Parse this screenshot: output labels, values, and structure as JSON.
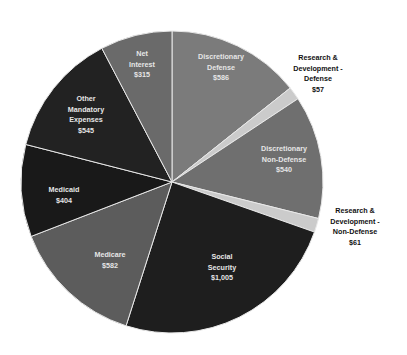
{
  "chart_data": {
    "type": "pie",
    "title": "",
    "start_angle_deg": 0,
    "direction": "clockwise",
    "center": [
      172,
      182
    ],
    "radius": 151,
    "slices": [
      {
        "label": "Discretionary Defense",
        "value": 586,
        "color": "#7b7b7b",
        "label_lines": [
          "Discretionary",
          "Defense",
          "$586"
        ],
        "label_pos": [
          221,
          52
        ],
        "label_style": "in"
      },
      {
        "label": "Research & Development - Defense",
        "value": 57,
        "color": "#cbcbcb",
        "label_lines": [
          "Research &",
          "Development -",
          "Defense",
          "$57"
        ],
        "label_pos": [
          318,
          53
        ],
        "label_style": "out"
      },
      {
        "label": "Discretionary Non-Defense",
        "value": 540,
        "color": "#6f6f6f",
        "label_lines": [
          "Discretionary",
          "Non-Defense",
          "$540"
        ],
        "label_pos": [
          284,
          144
        ],
        "label_style": "in"
      },
      {
        "label": "Research & Development - Non-Defense",
        "value": 61,
        "color": "#cbcbcb",
        "label_lines": [
          "Research &",
          "Development -",
          "Non-Defense",
          "$61"
        ],
        "label_pos": [
          355,
          206
        ],
        "label_style": "out"
      },
      {
        "label": "Social Security",
        "value": 1005,
        "color": "#1e1e1e",
        "label_lines": [
          "Social",
          "Security",
          "$1,005"
        ],
        "label_pos": [
          222,
          252
        ],
        "label_style": "in"
      },
      {
        "label": "Medicare",
        "value": 582,
        "color": "#5c5c5c",
        "label_lines": [
          "Medicare",
          "$582"
        ],
        "label_pos": [
          110,
          250
        ],
        "label_style": "in"
      },
      {
        "label": "Medicaid",
        "value": 404,
        "color": "#191919",
        "label_lines": [
          "Medicaid",
          "$404"
        ],
        "label_pos": [
          64,
          185
        ],
        "label_style": "in"
      },
      {
        "label": "Other Mandatory Expenses",
        "value": 545,
        "color": "#222222",
        "label_lines": [
          "Other",
          "Mandatory",
          "Expenses",
          "$545"
        ],
        "label_pos": [
          86,
          94
        ],
        "label_style": "in"
      },
      {
        "label": "Net Interest",
        "value": 315,
        "color": "#6a6a6a",
        "label_lines": [
          "Net",
          "Interest",
          "$315"
        ],
        "label_pos": [
          142,
          49
        ],
        "label_style": "in"
      }
    ],
    "total": 4095,
    "legend": null,
    "separator_color": "#e8e8e8"
  }
}
